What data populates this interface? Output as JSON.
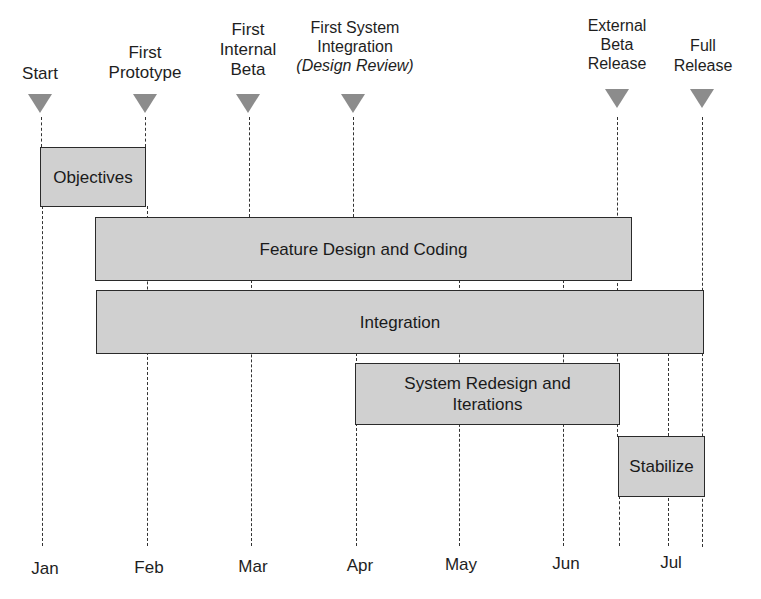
{
  "milestones": [
    {
      "label": "Start",
      "sub": "",
      "x": 40
    },
    {
      "label": "First\nPrototype",
      "sub": "",
      "x": 145
    },
    {
      "label": "First\nInternal\nBeta",
      "sub": "",
      "x": 248
    },
    {
      "label": "First System\nIntegration",
      "sub": "(Design Review)",
      "x": 353
    },
    {
      "label": "External\nBeta\nRelease",
      "sub": "",
      "x": 617
    },
    {
      "label": "Full\nRelease",
      "sub": "",
      "x": 702
    }
  ],
  "months": [
    {
      "label": "Jan",
      "x": 45
    },
    {
      "label": "Feb",
      "x": 149
    },
    {
      "label": "Mar",
      "x": 253
    },
    {
      "label": "Apr",
      "x": 360
    },
    {
      "label": "May",
      "x": 461
    },
    {
      "label": "Jun",
      "x": 566
    },
    {
      "label": "Jul",
      "x": 670
    }
  ],
  "tasks": [
    {
      "label": "Objectives",
      "start": "Start",
      "end": "First Prototype"
    },
    {
      "label": "Feature Design and Coding",
      "start": "Mid Jan",
      "end": "External Beta Release"
    },
    {
      "label": "Integration",
      "start": "Mid Jan",
      "end": "Full Release"
    },
    {
      "label": "System Redesign and Iterations",
      "start": "First System Integration",
      "end": "External Beta Release"
    },
    {
      "label": "Stabilize",
      "start": "External Beta Release",
      "end": "Full Release"
    }
  ],
  "colors": {
    "bar_fill": "#d0d0d0",
    "bar_border": "#2a2a2a",
    "milestone_marker": "#8c8c8c",
    "text": "#1a1a1a"
  }
}
